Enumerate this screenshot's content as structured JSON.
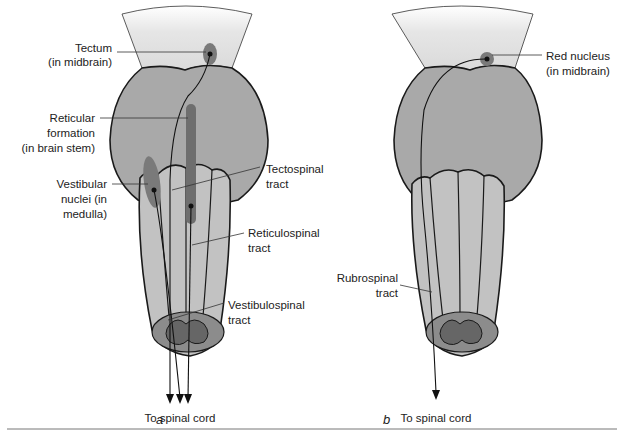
{
  "figure": {
    "panels": [
      {
        "id": "a",
        "label": "a",
        "labels": {
          "tectum_1": "Tectum",
          "tectum_2": "(in midbrain)",
          "reticular_1": "Reticular",
          "reticular_2": "formation",
          "reticular_3": "(in brain stem)",
          "vestibular_1": "Vestibular",
          "vestibular_2": "nuclei (in",
          "vestibular_3": "medulla)",
          "tectospinal_1": "Tectospinal",
          "tectospinal_2": "tract",
          "reticulospinal_1": "Reticulospinal",
          "reticulospinal_2": "tract",
          "vestibulospinal_1": "Vestibulospinal",
          "vestibulospinal_2": "tract",
          "destination": "To spinal cord"
        }
      },
      {
        "id": "b",
        "label": "b",
        "labels": {
          "red_nucleus_1": "Red nucleus",
          "red_nucleus_2": "(in midbrain)",
          "rubrospinal_1": "Rubrospinal",
          "rubrospinal_2": "tract",
          "destination": "To spinal cord"
        }
      }
    ],
    "colors": {
      "midbrain_top": "#f4f4f4",
      "midbrain": "#dcdcdc",
      "pons": "#a9a9a9",
      "medulla": "#c2c2c2",
      "nucleus": "#7a7a7a",
      "outline": "#1a1a1a"
    }
  }
}
